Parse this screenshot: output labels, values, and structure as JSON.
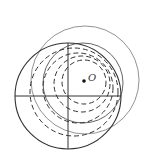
{
  "diagram": {
    "point_label": "O",
    "stroke_color": "#444444",
    "main_circle": {
      "cx": 68,
      "cy": 96,
      "r": 53
    },
    "outer_circle": {
      "cx": 85,
      "cy": 80,
      "r": 54
    },
    "middle_circle": {
      "cx": 83,
      "cy": 83,
      "r": 40
    },
    "dashed_circles": [
      {
        "cx": 84,
        "cy": 82,
        "r": 22
      },
      {
        "cx": 82,
        "cy": 84,
        "r": 28
      },
      {
        "cx": 78,
        "cy": 88,
        "r": 35
      },
      {
        "cx": 74,
        "cy": 92,
        "r": 44
      }
    ],
    "point": {
      "x": 84,
      "y": 81
    }
  }
}
